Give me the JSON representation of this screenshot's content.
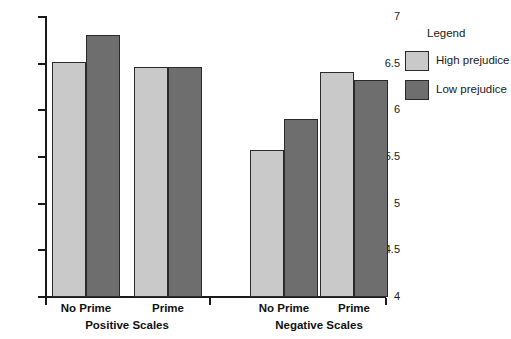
{
  "chart_data": {
    "type": "bar",
    "title": "",
    "xlabel": "",
    "ylabel": "",
    "ylim": [
      4,
      7
    ],
    "ytick_labels": [
      "7",
      "6.5",
      "6",
      "5.5",
      "5",
      "4.5",
      "4"
    ],
    "ytick_values": [
      7,
      6.5,
      6,
      5.5,
      5,
      4.5,
      4
    ],
    "grid": false,
    "legend": {
      "title": "Legend",
      "position": "right",
      "entries": [
        {
          "name": "High prejudice",
          "color": "#c9c9c9"
        },
        {
          "name": "Low prejudice",
          "color": "#6e6e6e"
        }
      ]
    },
    "groups": [
      {
        "name": "Positive Scales",
        "categories": [
          "No Prime",
          "Prime"
        ]
      },
      {
        "name": "Negative Scales",
        "categories": [
          "No Prime",
          "Prime"
        ]
      }
    ],
    "categories": [
      "No Prime",
      "Prime",
      "No Prime",
      "Prime"
    ],
    "series": [
      {
        "name": "High prejudice",
        "color": "#c9c9c9",
        "values": [
          6.52,
          6.46,
          5.58,
          6.41
        ]
      },
      {
        "name": "Low prejudice",
        "color": "#6e6e6e",
        "values": [
          6.81,
          6.46,
          5.91,
          6.32
        ]
      }
    ],
    "bars": [
      {
        "group": "Positive Scales",
        "category": "No Prime",
        "series": "High prejudice",
        "value": 6.52,
        "color": "#c9c9c9",
        "x": 52,
        "width": 34
      },
      {
        "group": "Positive Scales",
        "category": "No Prime",
        "series": "Low prejudice",
        "value": 6.81,
        "color": "#6e6e6e",
        "x": 86,
        "width": 34
      },
      {
        "group": "Positive Scales",
        "category": "Prime",
        "series": "High prejudice",
        "value": 6.46,
        "color": "#c9c9c9",
        "x": 134,
        "width": 34
      },
      {
        "group": "Positive Scales",
        "category": "Prime",
        "series": "Low prejudice",
        "value": 6.46,
        "color": "#6e6e6e",
        "x": 168,
        "width": 34
      },
      {
        "group": "Negative Scales",
        "category": "No Prime",
        "series": "High prejudice",
        "value": 5.58,
        "color": "#c9c9c9",
        "x": 250,
        "width": 34
      },
      {
        "group": "Negative Scales",
        "category": "No Prime",
        "series": "Low prejudice",
        "value": 5.91,
        "color": "#6e6e6e",
        "x": 284,
        "width": 34
      },
      {
        "group": "Negative Scales",
        "category": "Prime",
        "series": "High prejudice",
        "value": 6.41,
        "color": "#c9c9c9",
        "x": 320,
        "width": 34
      },
      {
        "group": "Negative Scales",
        "category": "Prime",
        "series": "Low prejudice",
        "value": 6.32,
        "color": "#6e6e6e",
        "x": 354,
        "width": 34
      }
    ],
    "axis": {
      "y_top_px": 17,
      "y_bottom_px": 297,
      "x_left_px": 46,
      "x_right_px": 386
    },
    "x_ticks_px": [
      46,
      210,
      386
    ]
  }
}
